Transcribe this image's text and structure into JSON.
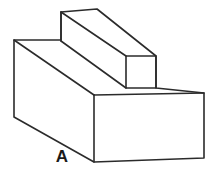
{
  "figure": {
    "kind": "isometric-line-drawing",
    "background_color": "#ffffff",
    "line_color": "#2b2b2b",
    "fill_color": "#ffffff",
    "line_width": 1.6,
    "labels": [
      {
        "name": "surface-label-a",
        "text": "A",
        "x": 62,
        "y": 162,
        "font_size": 17,
        "bold": true,
        "color": "#1a1a1a",
        "refers_to": "front-left-slanted-bottom-edge"
      }
    ],
    "vertices": {
      "base_top_back_left": [
        14,
        40
      ],
      "base_top_front_left": [
        14,
        117
      ],
      "base_bottom_front_left": [
        94,
        162
      ],
      "base_bottom_front_right": [
        204,
        158
      ],
      "base_top_front_right": [
        204,
        93
      ],
      "base_front_face_top_left": [
        94,
        95
      ],
      "rib_left_top_front": [
        61,
        12
      ],
      "rib_left_bottom_front": [
        61,
        41
      ],
      "rib_top_apex": [
        97,
        9
      ],
      "rib_end_top_left": [
        126,
        56
      ],
      "rib_end_top_right": [
        156,
        56
      ],
      "rib_end_bottom_right": [
        156,
        88
      ],
      "rib_end_bottom_left": [
        126,
        88
      ]
    },
    "paths": {
      "base_outline": "M 14 40 L 61 40 L 97 9 L 156 56 L 156 88 L 204 93 L 204 158 L 94 162 L 14 117 Z",
      "top_face_left_slope": "M 14 40 L 94 95",
      "top_face_right_edge": "M 94 95 L 204 93",
      "base_front_vertical": "M 94 95 L 94 162",
      "rib_left_vertical": "M 61 12 L 61 41",
      "rib_top_ridge": "M 61 12 L 97 9",
      "rib_left_slope_to_end": "M 61 41 L 126 88",
      "rib_ridge_slope_to_end": "M 61 12 L 126 56",
      "rib_apex_slope_to_end": "M 97 9 L 156 56",
      "rib_end_face": "M 126 56 L 156 56 L 156 88 L 126 88 Z"
    }
  }
}
